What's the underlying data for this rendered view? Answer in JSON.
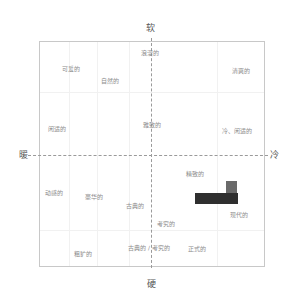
{
  "axes": {
    "top": "软",
    "bottom": "硬",
    "left": "暖",
    "right": "冷"
  },
  "words": [
    {
      "label": "浪漫的",
      "x": 141,
      "y": 50
    },
    {
      "label": "可爱的",
      "x": 62,
      "y": 66
    },
    {
      "label": "自然的",
      "x": 101,
      "y": 78
    },
    {
      "label": "清爽的",
      "x": 232,
      "y": 68
    },
    {
      "label": "闲适的",
      "x": 48,
      "y": 126
    },
    {
      "label": "雅致的",
      "x": 143,
      "y": 122
    },
    {
      "label": "冷、闲适的",
      "x": 222,
      "y": 128
    },
    {
      "label": "动感的",
      "x": 45,
      "y": 190
    },
    {
      "label": "豪华的",
      "x": 85,
      "y": 194
    },
    {
      "label": "精致的",
      "x": 186,
      "y": 171
    },
    {
      "label": "古典的",
      "x": 126,
      "y": 203
    },
    {
      "label": "现代的",
      "x": 230,
      "y": 212
    },
    {
      "label": "考究的",
      "x": 157,
      "y": 221
    },
    {
      "label": "古典的 / 考究的",
      "x": 128,
      "y": 245
    },
    {
      "label": "正式的",
      "x": 188,
      "y": 246
    },
    {
      "label": "粗犷的",
      "x": 74,
      "y": 251
    }
  ],
  "blocks": [
    {
      "name": "dark-block",
      "x": 195,
      "y": 193,
      "w": 43,
      "h": 11,
      "color": "#2f2f2f"
    },
    {
      "name": "gray-block",
      "x": 226,
      "y": 181,
      "w": 11,
      "h": 12,
      "color": "#6a6a6a"
    }
  ]
}
